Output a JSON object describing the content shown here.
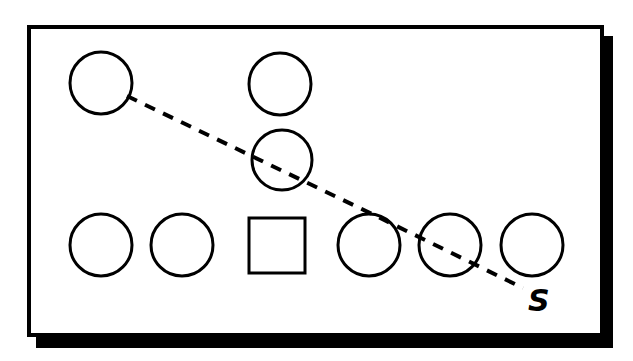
{
  "figure": {
    "background_color": "#ffffff",
    "ink_color": "#000000",
    "panel": {
      "name": "diagram-panel",
      "x": 27,
      "y": 25,
      "width": 577,
      "height": 312,
      "border_width": 4,
      "fill": "#ffffff",
      "stroke": "#000000",
      "shadow": {
        "offset_x": 9,
        "offset_y": 11,
        "color": "#000000"
      }
    },
    "nodes": [
      {
        "id": "n1",
        "shape": "circle",
        "cx": 101,
        "cy": 83,
        "r": 31,
        "stroke_width": 3,
        "row": "top",
        "label": ""
      },
      {
        "id": "n2",
        "shape": "circle",
        "cx": 280,
        "cy": 84,
        "r": 31,
        "stroke_width": 3,
        "row": "top",
        "label": ""
      },
      {
        "id": "n3",
        "shape": "circle",
        "cx": 282,
        "cy": 160,
        "r": 30,
        "stroke_width": 3,
        "row": "middle",
        "label": ""
      },
      {
        "id": "n4",
        "shape": "circle",
        "cx": 101,
        "cy": 245,
        "r": 31,
        "stroke_width": 3,
        "row": "bottom",
        "label": ""
      },
      {
        "id": "n5",
        "shape": "circle",
        "cx": 182,
        "cy": 245,
        "r": 31,
        "stroke_width": 3,
        "row": "bottom",
        "label": ""
      },
      {
        "id": "n6",
        "shape": "square",
        "x": 249,
        "y": 218,
        "width": 56,
        "height": 55,
        "stroke_width": 3,
        "row": "bottom",
        "label": ""
      },
      {
        "id": "n7",
        "shape": "circle",
        "cx": 369,
        "cy": 245,
        "r": 31,
        "stroke_width": 3,
        "row": "bottom",
        "label": ""
      },
      {
        "id": "n8",
        "shape": "circle",
        "cx": 450,
        "cy": 245,
        "r": 31,
        "stroke_width": 3,
        "row": "bottom",
        "label": ""
      },
      {
        "id": "n9",
        "shape": "circle",
        "cx": 532,
        "cy": 245,
        "r": 31,
        "stroke_width": 3,
        "row": "bottom",
        "label": ""
      }
    ],
    "path": {
      "name": "dashed-traversal-path",
      "style": "dashed",
      "stroke_width": 4,
      "dash_pattern": "11 9",
      "points": [
        {
          "x": 127,
          "y": 96
        },
        {
          "x": 372,
          "y": 214
        },
        {
          "x": 523,
          "y": 288
        }
      ]
    },
    "annotations": [
      {
        "name": "path-endpoint-label",
        "text": "S",
        "x": 528,
        "y": 311,
        "font_size": 30,
        "bold": true,
        "italic": true
      }
    ]
  }
}
